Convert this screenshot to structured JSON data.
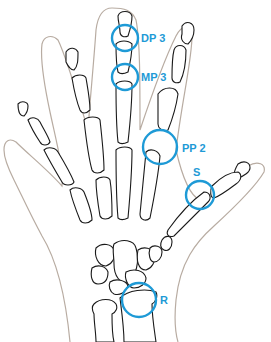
{
  "diagram": {
    "accent_color": "#1e9ad6",
    "skin_color": "#b8aca2",
    "bone_color": "#1a1a1a",
    "regions": [
      {
        "id": "dp3",
        "label": "DP 3",
        "cx": 125,
        "cy": 38,
        "r": 13,
        "lx": 141,
        "ly": 42
      },
      {
        "id": "mp3",
        "label": "MP 3",
        "cx": 125,
        "cy": 77,
        "r": 13,
        "lx": 141,
        "ly": 81
      },
      {
        "id": "pp2",
        "label": "PP 2",
        "cx": 160,
        "cy": 147,
        "r": 17,
        "lx": 182,
        "ly": 152
      },
      {
        "id": "s",
        "label": "S",
        "cx": 200,
        "cy": 195,
        "r": 14,
        "lx": 193,
        "ly": 176
      },
      {
        "id": "r",
        "label": "R",
        "cx": 139,
        "cy": 300,
        "r": 17,
        "lx": 160,
        "ly": 304
      }
    ]
  }
}
